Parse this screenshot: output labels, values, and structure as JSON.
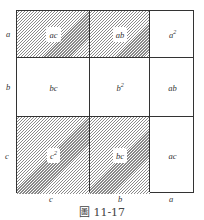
{
  "figure": {
    "caption": "圖 11-17",
    "left_labels": [
      "a",
      "b",
      "c"
    ],
    "bottom_labels": [
      "c",
      "b",
      "a"
    ],
    "cells": [
      [
        {
          "label": "ac",
          "sup": "",
          "hatched": true
        },
        {
          "label": "ab",
          "sup": "",
          "hatched": true
        },
        {
          "label": "a",
          "sup": "2",
          "hatched": false
        }
      ],
      [
        {
          "label": "bc",
          "sup": "",
          "hatched": false
        },
        {
          "label": "b",
          "sup": "2",
          "hatched": false
        },
        {
          "label": "ab",
          "sup": "",
          "hatched": false
        }
      ],
      [
        {
          "label": "c",
          "sup": "2",
          "hatched": true
        },
        {
          "label": "bc",
          "sup": "",
          "hatched": true
        },
        {
          "label": "ac",
          "sup": "",
          "hatched": false
        }
      ]
    ]
  }
}
